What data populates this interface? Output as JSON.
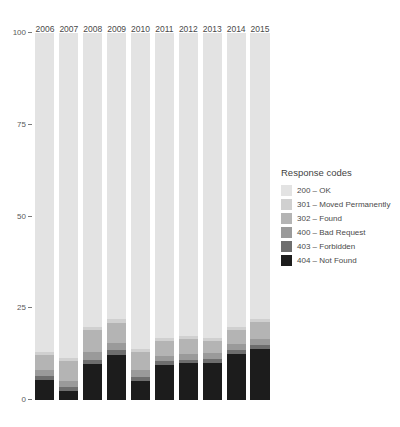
{
  "chart_data": {
    "type": "bar",
    "title": "",
    "xlabel": "",
    "ylabel": "",
    "stacked": true,
    "stack_mode": "percent",
    "grid": false,
    "legend_position": "right",
    "legend_title": "Response codes",
    "ylim": [
      0,
      100
    ],
    "y_ticks": [
      0,
      25,
      50,
      75,
      100
    ],
    "y_tick_labels": [
      "0",
      "25",
      "50",
      "75",
      "100"
    ],
    "categories": [
      "2006",
      "2007",
      "2008",
      "2009",
      "2010",
      "2011",
      "2012",
      "2013",
      "2014",
      "2015"
    ],
    "series": [
      {
        "name": "200 – OK",
        "code": "200",
        "color": "#e3e3e3",
        "values": [
          87.0,
          88.5,
          80.0,
          78.0,
          86.0,
          83.0,
          82.5,
          83.0,
          80.0,
          78.0
        ]
      },
      {
        "name": "301 – Moved Permanently",
        "code": "301",
        "color": "#d0d0d0",
        "values": [
          0.8,
          0.8,
          1.0,
          1.0,
          0.9,
          0.9,
          0.9,
          0.8,
          0.8,
          0.8
        ]
      },
      {
        "name": "302 – Found",
        "code": "302",
        "color": "#b4b4b4",
        "values": [
          4.0,
          5.5,
          6.0,
          5.5,
          5.0,
          4.0,
          4.0,
          3.5,
          4.0,
          4.5
        ]
      },
      {
        "name": "400 – Bad Request",
        "code": "400",
        "color": "#9a9a9a",
        "values": [
          1.7,
          1.6,
          2.0,
          2.0,
          1.8,
          1.6,
          1.6,
          1.5,
          1.6,
          1.7
        ]
      },
      {
        "name": "403 – Forbidden",
        "code": "403",
        "color": "#6e6e6e",
        "values": [
          1.0,
          1.1,
          1.2,
          1.2,
          1.1,
          1.0,
          1.0,
          1.0,
          1.1,
          1.2
        ]
      },
      {
        "name": "404 – Not Found",
        "code": "404",
        "color": "#1c1c1c",
        "values": [
          5.5,
          2.5,
          9.8,
          12.3,
          5.2,
          9.5,
          10.0,
          10.2,
          12.5,
          13.8
        ]
      }
    ]
  }
}
